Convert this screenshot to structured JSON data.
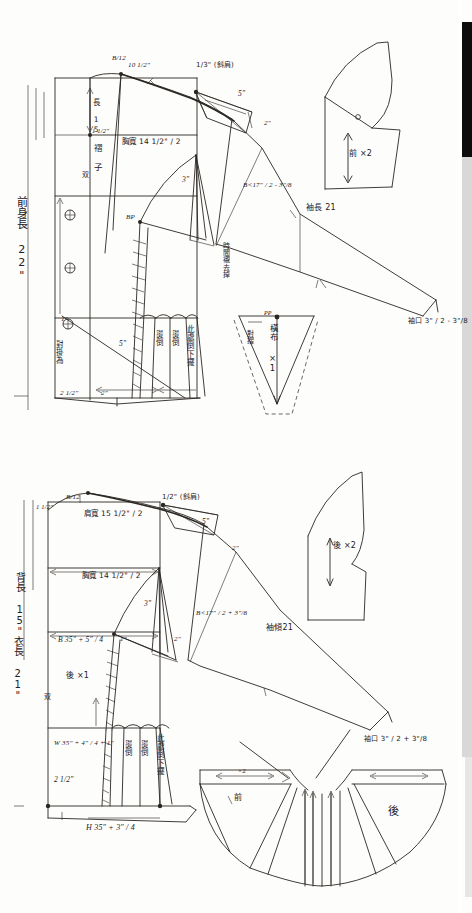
{
  "document": {
    "kind": "hand-drawn-sewing-pattern-draft",
    "title": "Bodice and sleeve drafting sheet",
    "width_px": 472,
    "height_px": 913,
    "ink_color": "#23201d",
    "paper_color": "#fdfdfc",
    "scanner_edge_color": "#0d0d0d"
  },
  "front_draft": {
    "name": "front-bodice-draft",
    "body_length": "前身長 22\"",
    "labels": {
      "shoulder_slope_formula": "B/12",
      "neck_width": "10 1/2\"",
      "shoulder_drop": "1/3\" (斜肩)",
      "shoulder_length": "5\"",
      "armhole_notch": "2\"",
      "back_length_mark": "長 15",
      "neck_depth": "1 1/2\"",
      "fold_note": "褶 子",
      "double_note": "双",
      "chest_width": "胸寬 14 1/2\" / 2",
      "bust_formula": "B<17\" / 2  -  3\"/8",
      "sleeve_length": "袖長 21",
      "cuff_formula": "袖口 3\" / 2  -  3\"/8",
      "dart_three": "3\"",
      "bp_point": "BP",
      "interfacing_note": "時間襯去掉",
      "hem_one": "1\"",
      "waist_left": "2 1/2\"",
      "waist_right": "2\"",
      "pleat_five": "5\"",
      "lap_note": "對掛為",
      "pleat_press_1": "燙倒",
      "pleat_press_2": "燙倒",
      "pleat_press_3": "此處倒下擺",
      "hem_two": "2\"",
      "hem_three": "3\""
    }
  },
  "front_facing_piece": {
    "name": "front-facing-piece",
    "grain_label": "前 ×2"
  },
  "bias_piece": {
    "name": "bias-strip-piece",
    "label": "橫布 ×1",
    "fold_note": "對摺",
    "notch": "PP"
  },
  "back_draft": {
    "name": "back-bodice-draft",
    "back_length": "背長 15\"",
    "garment_length": "衣長 21\"",
    "labels": {
      "shoulder_slope_formula": "B/12",
      "neck_rise": "1 1/2\"",
      "shoulder_drop": "1/2\" (斜肩)",
      "shoulder_width": "肩寬 15 1/2\" / 2",
      "shoulder_length": "5\"",
      "armhole_notch": "2\"",
      "chest_width": "胸寬 14 1/2\" / 2",
      "bust_quarter": "B 35\" + 5\" / 4",
      "bust_formula": "B<17\" / 2  +  3\"/8",
      "sleeve_length": "袖傾21",
      "dart_three": "3\"",
      "dart_one": "1\"",
      "dart_two": "2\"",
      "back_piece_note": "後 ×1",
      "double_note": "双",
      "waist_formula": "W 35\" + 4\" / 4  + 1\"",
      "waist_left": "2 1/2\"",
      "hip_formula": "H 35\" + 3\" / 4",
      "cuff_formula": "袖口 3\" / 2  +  3\"/8",
      "pleat_press_1": "燙倒",
      "pleat_press_2": "燙倒",
      "pleat_press_3": "此處倒下擺"
    }
  },
  "back_facing_piece": {
    "name": "back-facing-piece",
    "grain_label": "後 ×2"
  },
  "flared_collar": {
    "name": "flared-collar-piece",
    "front_label": "前",
    "back_label": "後",
    "grain_label": "×2"
  }
}
